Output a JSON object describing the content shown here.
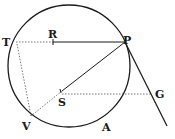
{
  "diagram": {
    "type": "geometry",
    "colors": {
      "stroke": "#1a1a1a",
      "dotted": "#555555",
      "background": "#ffffff"
    },
    "circle": {
      "cx": 69,
      "cy": 66,
      "r": 61
    },
    "points": {
      "T": {
        "label": "T",
        "x": 16,
        "y": 42
      },
      "R": {
        "label": "R",
        "x": 53,
        "y": 42
      },
      "P": {
        "label": "P",
        "x": 125,
        "y": 42
      },
      "S": {
        "label": "S",
        "x": 62,
        "y": 91
      },
      "V": {
        "label": "V",
        "x": 31,
        "y": 116
      },
      "G": {
        "label": "G",
        "x": 152,
        "y": 94
      },
      "A": {
        "label": "A",
        "x": 107,
        "y": 128
      }
    },
    "segments": [
      {
        "from": "R",
        "to": "P",
        "style": "solid"
      },
      {
        "from": "T",
        "to": "R",
        "style": "dotted"
      },
      {
        "from": "P",
        "to": "S",
        "style": "solid"
      },
      {
        "from": "S",
        "to": "V",
        "style": "dotted"
      },
      {
        "from": "T",
        "to": "V",
        "style": "dotted"
      },
      {
        "from": "S",
        "to": "G",
        "style": "dotted"
      },
      {
        "from": "P",
        "to": "tangent-end",
        "style": "solid"
      }
    ]
  }
}
